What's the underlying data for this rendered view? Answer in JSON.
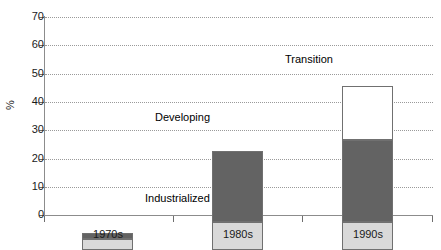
{
  "chart_data": {
    "type": "bar",
    "subtype": "stacked-bar",
    "title": "",
    "subtitle": "",
    "xlabel": "",
    "ylabel": "%",
    "categories": [
      "1970s",
      "1980s",
      "1990s"
    ],
    "ylim": [
      0,
      70
    ],
    "ytick_labels": [
      "0",
      "10",
      "20",
      "30",
      "40",
      "50",
      "60",
      "70"
    ],
    "ytick_values": [
      0,
      10,
      20,
      30,
      40,
      50,
      60,
      70
    ],
    "grid": true,
    "grid_style": "dotted-horizontal",
    "legend_position": "in-plot-annotations",
    "series": [
      {
        "name": "Industrialized",
        "color": "#d9d9d9",
        "values": [
          4,
          10,
          10
        ]
      },
      {
        "name": "Developing",
        "color": "#636363",
        "values": [
          2,
          25,
          29
        ]
      },
      {
        "name": "Transition",
        "color": "#ffffff",
        "values": [
          0,
          0,
          19
        ]
      }
    ],
    "totals": [
      6,
      35,
      58
    ],
    "annotations": [
      {
        "text": "Transition",
        "x_px": 283,
        "y_px": 53
      },
      {
        "text": "Developing",
        "x_px": 153,
        "y_px": 111
      },
      {
        "text": "Industrialized",
        "x_px": 143,
        "y_px": 192
      }
    ]
  },
  "axis": {
    "y_title": "%",
    "y_ticks": [
      {
        "label": "70",
        "value": 70
      },
      {
        "label": "60",
        "value": 60
      },
      {
        "label": "50",
        "value": 50
      },
      {
        "label": "40",
        "value": 40
      },
      {
        "label": "30",
        "value": 30
      },
      {
        "label": "20",
        "value": 20
      },
      {
        "label": "10",
        "value": 10
      },
      {
        "label": "0",
        "value": 0
      }
    ],
    "x_ticks": [
      {
        "label": "1970s"
      },
      {
        "label": "1980s"
      },
      {
        "label": "1990s"
      }
    ]
  },
  "colors": {
    "industrialized": "#d9d9d9",
    "developing": "#636363",
    "transition": "#ffffff",
    "bar_border": "#707070",
    "axis": "#8c8c8c",
    "gridline": "#9a9a9a",
    "text": "#1a1a1a",
    "background": "#ffffff"
  }
}
